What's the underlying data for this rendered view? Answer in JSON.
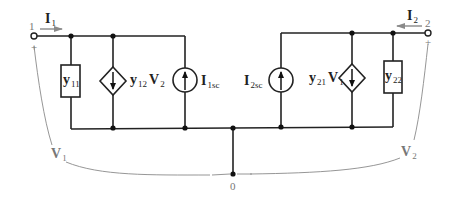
{
  "diagram": {
    "type": "two-port y-parameter equivalent circuit",
    "colors": {
      "wire": "#222222",
      "annotation": "#8a8a8a"
    },
    "terminals": [
      {
        "id": "port-1",
        "label": "1",
        "polarity": "+"
      },
      {
        "id": "port-2",
        "label": "2",
        "polarity": "+"
      },
      {
        "id": "ground",
        "label": "0"
      }
    ],
    "currents": [
      {
        "id": "I1",
        "main": "I",
        "sub": "1",
        "direction": "into port 1"
      },
      {
        "id": "I2",
        "main": "I",
        "sub": "2",
        "direction": "into port 2"
      }
    ],
    "voltages": [
      {
        "id": "V1",
        "main": "V",
        "sub": "1"
      },
      {
        "id": "V2",
        "main": "V",
        "sub": "2"
      }
    ],
    "elements": [
      {
        "id": "y11",
        "kind": "admittance",
        "main": "y",
        "sub": "11"
      },
      {
        "id": "dep1",
        "kind": "dependent current source (down)",
        "main1": "y",
        "sub1": "12",
        "main2": "V",
        "sub2": "2"
      },
      {
        "id": "I1sc",
        "kind": "independent current source (up)",
        "main": "I",
        "sub": "1sc"
      },
      {
        "id": "I2sc",
        "kind": "independent current source (up)",
        "main": "I",
        "sub": "2sc"
      },
      {
        "id": "dep2",
        "kind": "dependent current source (down)",
        "main1": "y",
        "sub1": "21",
        "main2": "V",
        "sub2": "1"
      },
      {
        "id": "y22",
        "kind": "admittance",
        "main": "y",
        "sub": "22"
      }
    ]
  }
}
